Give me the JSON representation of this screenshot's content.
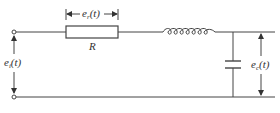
{
  "diagram": {
    "type": "circuit",
    "colors": {
      "stroke": "#444444",
      "background": "#ffffff",
      "text": "#333333"
    },
    "components": [
      {
        "id": "R",
        "kind": "resistor",
        "label": "R"
      },
      {
        "id": "L",
        "kind": "inductor",
        "label": ""
      },
      {
        "id": "C",
        "kind": "capacitor",
        "label": ""
      }
    ],
    "labels": {
      "resistor": "R",
      "resistor_voltage": {
        "base": "e",
        "sub": "r",
        "arg": "(t)"
      },
      "input_voltage": {
        "base": "e",
        "sub": "i",
        "arg": "(t)"
      },
      "output_voltage": {
        "base": "e",
        "sub": "c",
        "arg": "(t)"
      }
    },
    "terminals": [
      {
        "id": "in-top",
        "kind": "open-terminal"
      },
      {
        "id": "in-bottom",
        "kind": "open-terminal"
      }
    ]
  }
}
